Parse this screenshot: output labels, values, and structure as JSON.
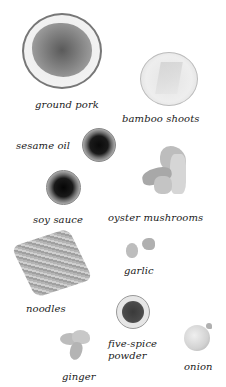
{
  "ingredients": [
    {
      "id": "ground-pork",
      "label": "ground pork"
    },
    {
      "id": "bamboo-shoots",
      "label": "bamboo shoots"
    },
    {
      "id": "sesame-oil",
      "label": "sesame oil"
    },
    {
      "id": "soy-sauce",
      "label": "soy sauce"
    },
    {
      "id": "oyster-mushrooms",
      "label": "oyster mushrooms"
    },
    {
      "id": "noodles",
      "label": "noodles"
    },
    {
      "id": "garlic",
      "label": "garlic"
    },
    {
      "id": "five-spice-powder",
      "label_line1": "five-spice",
      "label_line2": "powder"
    },
    {
      "id": "ginger",
      "label": "ginger"
    },
    {
      "id": "onion",
      "label": "onion"
    }
  ],
  "colors": {
    "background": "#ffffff",
    "text": "#1a1a1a"
  }
}
